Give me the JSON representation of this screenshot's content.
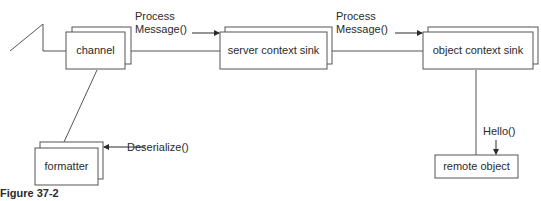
{
  "diagram": {
    "nodes": {
      "channel": {
        "label": "channel"
      },
      "server_sink": {
        "label": "server context sink"
      },
      "object_sink": {
        "label": "object context sink"
      },
      "formatter": {
        "label": "formatter"
      },
      "remote_object": {
        "label": "remote object"
      }
    },
    "edges": {
      "process1": {
        "line1": "Process",
        "line2": "Message()"
      },
      "process2": {
        "line1": "Process",
        "line2": "Message()"
      },
      "deserialize": {
        "label": "Deserialize()"
      },
      "hello": {
        "label": "Hello()"
      }
    },
    "caption": "Figure 37-2"
  }
}
